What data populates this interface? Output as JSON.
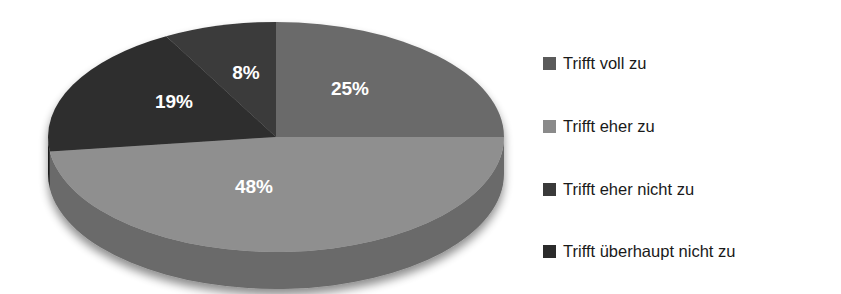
{
  "chart_data": {
    "type": "pie",
    "title": "",
    "subtitle": "",
    "xlabel": "",
    "ylabel": "",
    "grid": false,
    "three_d": true,
    "start_angle_deg": 0,
    "direction": "clockwise",
    "legend_position": "right",
    "value_unit": "%",
    "categories": [
      "Trifft voll zu",
      "Trifft eher zu",
      "Trifft eher nicht zu",
      "Trifft überhaupt nicht zu"
    ],
    "values": [
      25,
      48,
      19,
      8
    ],
    "data_labels": [
      "25%",
      "48%",
      "19%",
      "8%"
    ],
    "colors": [
      "#6b6b6b",
      "#8f8f8f",
      "#2e2e2e",
      "#3a3a3a"
    ],
    "side_colors": [
      "#4a4a4a",
      "#6a6a6a",
      "#1c1c1c",
      "#232323"
    ],
    "label_color": "#ffffff",
    "background_color": "#ffffff",
    "slices": [
      {
        "label": "Trifft voll zu",
        "value": 25,
        "data_label": "25%",
        "color": "#6b6b6b",
        "side_color": "#4a4a4a",
        "label_x": 350,
        "label_y": 90
      },
      {
        "label": "Trifft eher zu",
        "value": 48,
        "data_label": "48%",
        "color": "#8f8f8f",
        "side_color": "#6a6a6a",
        "label_x": 254,
        "label_y": 188
      },
      {
        "label": "Trifft eher nicht zu",
        "value": 19,
        "data_label": "19%",
        "color": "#2e2e2e",
        "side_color": "#1c1c1c",
        "label_x": 174,
        "label_y": 103
      },
      {
        "label": "Trifft überhaupt nicht zu",
        "value": 8,
        "data_label": "8%",
        "color": "#3a3a3a",
        "side_color": "#232323",
        "label_x": 246,
        "label_y": 74
      }
    ]
  },
  "legend": {
    "items": [
      {
        "label": "Trifft voll zu",
        "color": "#5a5a5a",
        "top": 13
      },
      {
        "label": "Trifft eher zu",
        "color": "#8a8a8a",
        "top": 76
      },
      {
        "label": "Trifft eher nicht zu",
        "color": "#3a3a3a",
        "top": 139
      },
      {
        "label": "Trifft überhaupt nicht zu",
        "color": "#2b2b2b",
        "top": 201
      }
    ]
  }
}
